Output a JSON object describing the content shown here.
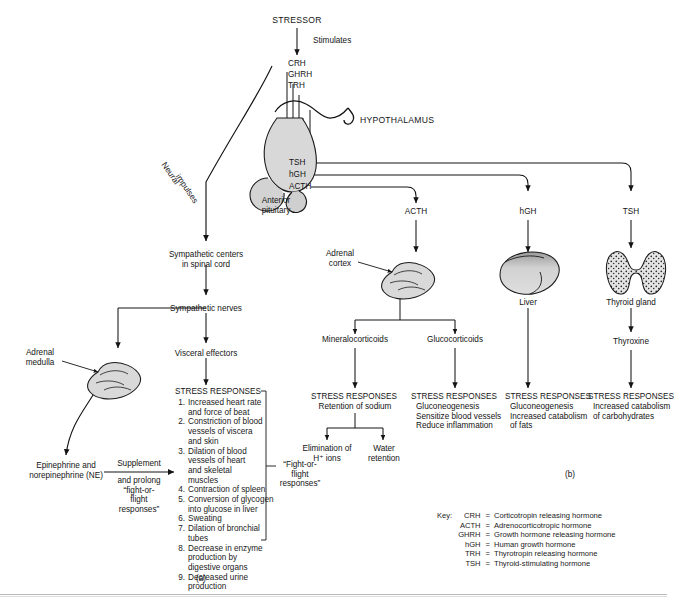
{
  "figure": {
    "panel_a_label": "(a)",
    "panel_b_label": "(b)"
  },
  "nodes": {
    "stressor": "STRESSOR",
    "stimulates": "Stimulates",
    "crh": "CRH",
    "ghrh": "GHRH",
    "trh": "TRH",
    "hypothalamus": "HYPOTHALAMUS",
    "tsh_pit": "TSH",
    "hgh_pit": "hGH",
    "acth_pit": "ACTH",
    "anterior_pituitary": "Anterior\npituitary",
    "neural_impulses_1": "Neural",
    "neural_impulses_2": "impulses",
    "sympathetic_centers": "Sympathetic centers\nin spinal cord",
    "sympathetic_nerves": "Sympathetic nerves",
    "visceral_effectors": "Visceral effectors",
    "adrenal_medulla": "Adrenal\nmedulla",
    "epinephrine": "Epinephrine and\nnorepinephrine (NE)",
    "supplement_top": "Supplement",
    "supplement_bottom": "and prolong\n“fight-or-\nflight\nresponses”",
    "fight_or_flight": "“Fight-or-\nflight\nresponses”",
    "acth_branch": "ACTH",
    "hgh_branch": "hGH",
    "tsh_branch": "TSH",
    "adrenal_cortex": "Adrenal\ncortex",
    "liver": "Liver",
    "thyroid_gland": "Thyroid gland",
    "mineralocorticoids": "Mineralocorticoids",
    "glucocorticoids": "Glucocorticoids",
    "thyroxine": "Thyroxine"
  },
  "stress_responses_left": {
    "heading": "STRESS RESPONSES",
    "items": [
      {
        "n": "1.",
        "text": "Increased heart rate\nand force of beat"
      },
      {
        "n": "2.",
        "text": "Constriction of blood\nvessels of viscera\nand skin"
      },
      {
        "n": "3.",
        "text": "Dilation of blood\nvessels of heart\nand skeletal\nmuscles"
      },
      {
        "n": "4.",
        "text": "Contraction of spleen"
      },
      {
        "n": "5.",
        "text": "Conversion of glycogen\ninto glucose in liver"
      },
      {
        "n": "6.",
        "text": "Sweating"
      },
      {
        "n": "7.",
        "text": "Dilation of bronchial\ntubes"
      },
      {
        "n": "8.",
        "text": "Decrease in enzyme\nproduction by\ndigestive organs"
      },
      {
        "n": "9.",
        "text": "Decreased urine\nproduction"
      }
    ]
  },
  "stress_responses_mineralo": {
    "heading": "STRESS RESPONSES",
    "lines": [
      "Retention of sodium"
    ],
    "sub_left": "Elimination of\nH⁺ ions",
    "sub_right": "Water\nretention"
  },
  "stress_responses_gluco": {
    "heading": "STRESS RESPONSES",
    "lines": [
      "Gluconeogenesis",
      "Sensitize blood vessels",
      "Reduce inflammation"
    ]
  },
  "stress_responses_liver": {
    "heading": "STRESS RESPONSES",
    "lines": [
      "Gluconeogenesis",
      "Increased catabolism",
      "of fats"
    ]
  },
  "stress_responses_thyroid": {
    "heading": "STRESS RESPONSES",
    "lines": [
      "Increased catabolism",
      "of carbohydrates"
    ]
  },
  "key": {
    "title": "Key:",
    "entries": [
      {
        "abbr": "CRH",
        "eq": "=",
        "desc": "Corticotropin releasing hormone"
      },
      {
        "abbr": "ACTH",
        "eq": "=",
        "desc": "Adrenocorticotropic hormone"
      },
      {
        "abbr": "GHRH",
        "eq": "=",
        "desc": "Growth hormone releasing hormone"
      },
      {
        "abbr": "hGH",
        "eq": "=",
        "desc": "Human growth hormone"
      },
      {
        "abbr": "TRH",
        "eq": "=",
        "desc": "Thyrotropin releasing hormone"
      },
      {
        "abbr": "TSH",
        "eq": "=",
        "desc": "Thyroid-stimulating hormone"
      }
    ]
  },
  "colors": {
    "ink": "#141414",
    "organ_fill": "#d9d9d9",
    "organ_stroke": "#1a1a1a",
    "rule": "#b9b9b9",
    "background": "#ffffff"
  }
}
